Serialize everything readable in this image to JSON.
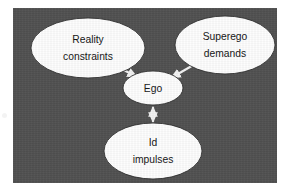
{
  "figure": {
    "type": "diagram",
    "subtype": "node-link-diagram",
    "title": "",
    "panel_background_color": "#515151",
    "node_fill_color": "#fdfdfd",
    "node_stroke_color": "#2e2e2e",
    "connector_color": "#f2f2f2",
    "label_color": "#141414",
    "page_background_color": "#ffffff"
  },
  "nodes": [
    {
      "id": "reality",
      "lines": [
        "Reality",
        "constraints"
      ],
      "line1": "Reality",
      "line2": "constraints",
      "shape": "ellipse",
      "cx": 75,
      "cy": 40,
      "rx": 57,
      "ry": 30
    },
    {
      "id": "superego",
      "lines": [
        "Superego",
        "demands"
      ],
      "line1": "Superego",
      "line2": "demands",
      "shape": "ellipse",
      "cx": 212,
      "cy": 37,
      "rx": 50,
      "ry": 29
    },
    {
      "id": "ego",
      "lines": [
        "Ego"
      ],
      "line1": "Ego",
      "shape": "ellipse",
      "cx": 140,
      "cy": 80,
      "rx": 30,
      "ry": 17
    },
    {
      "id": "idimpulses",
      "lines": [
        "Id",
        "impulses"
      ],
      "line1": "Id",
      "line2": "impulses",
      "shape": "ellipse",
      "cx": 140,
      "cy": 143,
      "rx": 49,
      "ry": 28
    }
  ],
  "connectors": [
    {
      "id": "ego-reality",
      "from": "ego",
      "to": "reality",
      "arrow": "double",
      "label": ""
    },
    {
      "id": "ego-superego",
      "from": "ego",
      "to": "superego",
      "arrow": "double",
      "label": ""
    },
    {
      "id": "ego-id",
      "from": "ego",
      "to": "idimpulses",
      "arrow": "double",
      "label": ""
    }
  ]
}
